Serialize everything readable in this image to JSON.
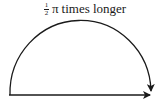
{
  "diagram": {
    "label": {
      "fraction_numerator": "1",
      "fraction_denominator": "2",
      "symbol": "π",
      "text": "times longer"
    },
    "shapes": [
      {
        "type": "semicircle-arc",
        "direction": "left-to-right",
        "arrowhead": "end"
      },
      {
        "type": "straight-line",
        "direction": "left-to-right",
        "arrowhead": "end"
      }
    ],
    "colors": {
      "stroke": "#1a1a1a",
      "background": "#ffffff"
    }
  }
}
